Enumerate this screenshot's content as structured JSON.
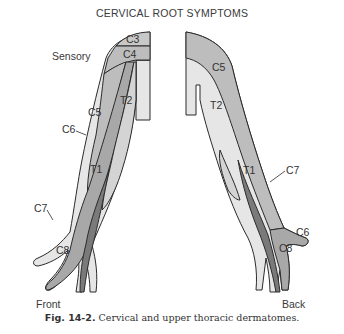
{
  "title": "CERVICAL ROOT SYMPTOMS",
  "sensory_label": "Sensory",
  "views": {
    "front": {
      "label": "Front",
      "dermatomes": [
        "C3",
        "C4",
        "C5",
        "T2",
        "C6",
        "T1",
        "C7",
        "C8"
      ]
    },
    "back": {
      "label": "Back",
      "dermatomes": [
        "C5",
        "T2",
        "T1",
        "C7",
        "C6",
        "C8"
      ]
    }
  },
  "caption": {
    "prefix": "Fig. 14-2.",
    "text": " Cervical and upper thoracic dermatomes."
  },
  "colors": {
    "light": "#e6e6e6",
    "medium": "#bdbdbd",
    "dark": "#8c8c8c",
    "darkest": "#6e6e6e",
    "outline": "#2b2b2b"
  }
}
